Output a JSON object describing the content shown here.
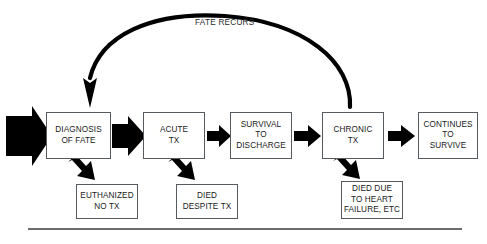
{
  "diagram": {
    "background_color": "#ffffff",
    "line_color": "#000000",
    "box_border_color": "#555a5e",
    "text_color": "#1a1a1a",
    "nodes": [
      {
        "id": "diagnosis",
        "label": "DIAGNOSIS\nOF FATE",
        "x": 46,
        "y": 112,
        "w": 65,
        "h": 47
      },
      {
        "id": "acute",
        "label": "ACUTE\nTX",
        "x": 143,
        "y": 112,
        "w": 62,
        "h": 47
      },
      {
        "id": "survival",
        "label": "SURVIVAL\nTO\nDISCHARGE",
        "x": 230,
        "y": 112,
        "w": 62,
        "h": 47
      },
      {
        "id": "chronic",
        "label": "CHRONIC\nTX",
        "x": 322,
        "y": 112,
        "w": 62,
        "h": 47
      },
      {
        "id": "continues",
        "label": "CONTINUES\nTO\nSURVIVE",
        "x": 418,
        "y": 112,
        "w": 60,
        "h": 47
      },
      {
        "id": "euthanized",
        "label": "EUTHANIZED\nNO TX",
        "x": 76,
        "y": 184,
        "w": 62,
        "h": 35
      },
      {
        "id": "died-acute",
        "label": "DIED\nDESPITE TX",
        "x": 176,
        "y": 184,
        "w": 62,
        "h": 35
      },
      {
        "id": "died-heart",
        "label": "DIED DUE\nTO HEART\nFAILURE, ETC",
        "x": 341,
        "y": 181,
        "w": 62,
        "h": 38
      }
    ],
    "edge_labels": [
      {
        "id": "fate-recurs",
        "text": "FATE RECURS",
        "x": 195,
        "y": 18
      }
    ],
    "recursion_arrow": {
      "label": "FATE RECURS",
      "from": "chronic",
      "to": "diagnosis"
    },
    "entry_arrow": {
      "id": "entry-arrow",
      "description": "large block arrow entering from left edge"
    },
    "footer_rule": {
      "x1": 28,
      "x2": 462,
      "y": 229
    }
  }
}
